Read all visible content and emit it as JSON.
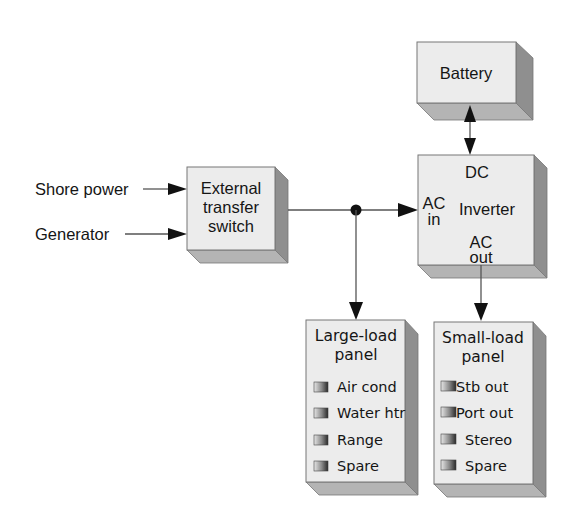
{
  "inputs": {
    "shore_power": "Shore power",
    "generator": "Generator"
  },
  "transfer_switch": {
    "line1": "External",
    "line2": "transfer",
    "line3": "switch"
  },
  "battery": {
    "label": "Battery"
  },
  "inverter": {
    "dc": "DC",
    "ac_in_1": "AC",
    "ac_in_2": "in",
    "title": "Inverter",
    "ac_out_1": "AC",
    "ac_out_2": "out"
  },
  "large_load_panel": {
    "title_1": "Large-load",
    "title_2": "panel",
    "items": [
      "Air cond",
      "Water htr",
      "Range",
      "Spare"
    ]
  },
  "small_load_panel": {
    "title_1": "Small-load",
    "title_2": "panel",
    "items": [
      "Stb out",
      "Port out",
      "Stereo",
      "Spare"
    ]
  },
  "colors": {
    "front_face": "#ececec",
    "side_face": "#8f8f8f",
    "bottom_face": "#b4b4b4",
    "line": "#555555",
    "arrow": "#111111"
  }
}
